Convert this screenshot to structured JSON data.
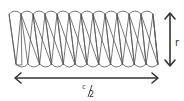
{
  "diagram": {
    "sectors_total": 24,
    "sectors_pointing_down": 12,
    "sectors_pointing_up": 12,
    "height_label": "r",
    "width_label_numerator": "c",
    "width_label_denominator": "2",
    "colors": {
      "stroke": "#555555",
      "arrow": "#333333",
      "text": "#333333",
      "background": "#ffffff"
    }
  }
}
